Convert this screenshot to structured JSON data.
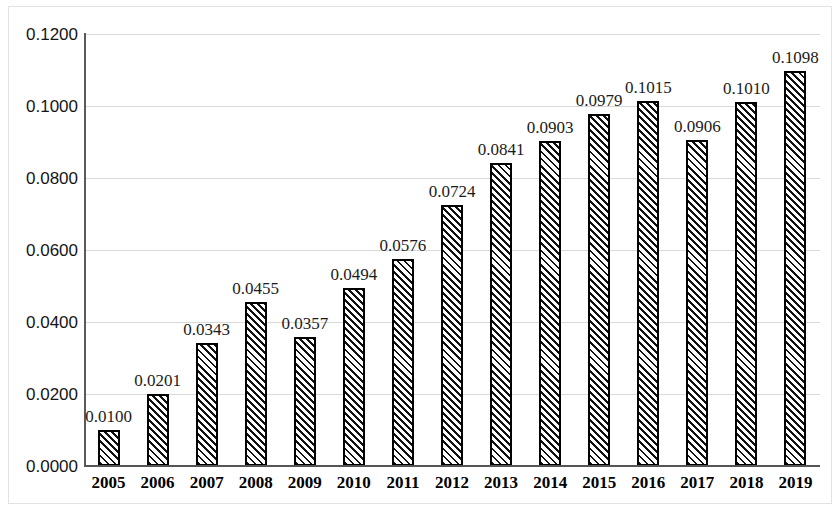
{
  "chart_data": {
    "type": "bar",
    "title": "",
    "subtitle": "",
    "xlabel": "",
    "ylabel": "",
    "categories": [
      "2005",
      "2006",
      "2007",
      "2008",
      "2009",
      "2010",
      "2011",
      "2012",
      "2013",
      "2014",
      "2015",
      "2016",
      "2017",
      "2018",
      "2019"
    ],
    "values": [
      0.01,
      0.0201,
      0.0343,
      0.0455,
      0.0357,
      0.0494,
      0.0576,
      0.0724,
      0.0841,
      0.0903,
      0.0979,
      0.1015,
      0.0906,
      0.101,
      0.1098
    ],
    "data_labels": [
      "0.0100",
      "0.0201",
      "0.0343",
      "0.0455",
      "0.0357",
      "0.0494",
      "0.0576",
      "0.0724",
      "0.0841",
      "0.0903",
      "0.0979",
      "0.1015",
      "0.0906",
      "0.1010",
      "0.1098"
    ],
    "ylim": [
      0.0,
      0.12
    ],
    "ytick_values": [
      0.0,
      0.02,
      0.04,
      0.06,
      0.08,
      0.1,
      0.12
    ],
    "ytick_labels": [
      "0.0000",
      "0.0200",
      "0.0400",
      "0.0600",
      "0.0800",
      "0.1000",
      "0.1200"
    ],
    "grid": true,
    "grid_axis": "y",
    "legend": null,
    "legend_position": "none",
    "bar_fill": "diagonal-hatch",
    "bar_border_color": "#000000",
    "grid_color": "#d9d9d9",
    "axis_color": "#555555",
    "text_color": "#111111"
  }
}
